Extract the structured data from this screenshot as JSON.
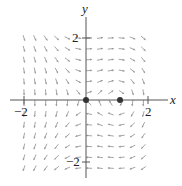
{
  "figure": {
    "type": "vector-field",
    "axes": {
      "x_label": "x",
      "y_label": "y",
      "x_ticks": [
        {
          "value": -2,
          "label": "−2"
        },
        {
          "value": 2,
          "label": "2"
        }
      ],
      "y_ticks": [
        {
          "value": 2,
          "label": "2"
        },
        {
          "value": -2,
          "label": "−2"
        }
      ],
      "range": {
        "x": [
          -2.5,
          2.6
        ],
        "y": [
          -2.6,
          2.6
        ]
      }
    },
    "equilibrium_points": [
      {
        "x": 0,
        "y": 0
      },
      {
        "x": 1,
        "y": 0
      }
    ],
    "colors": {
      "axis": "#555555",
      "arrow": "#9a9a9a",
      "point": "#333333"
    },
    "grid_spacing": 0.35
  }
}
